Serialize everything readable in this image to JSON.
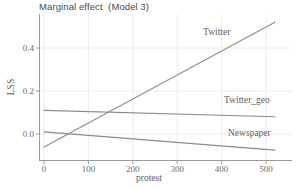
{
  "chart_data": {
    "type": "line",
    "title": "Marginal effect  (Model 3)",
    "xlabel": "protest",
    "ylabel": "LSS",
    "xlim": [
      -18,
      530
    ],
    "ylim": [
      -0.105,
      0.545
    ],
    "xticks": [
      0,
      100,
      200,
      300,
      400,
      500
    ],
    "xticklabels": [
      "0",
      "100",
      "200",
      "300",
      "400",
      "500"
    ],
    "yticks": [
      0.0,
      0.2,
      0.4
    ],
    "yticklabels": [
      "0.0",
      "0.2",
      "0.4"
    ],
    "grid": true,
    "legend_position": "inline-annotations",
    "series": [
      {
        "name": "Twitter",
        "color": "#8c8c8c",
        "x": [
          0,
          520
        ],
        "values": [
          -0.06,
          0.52
        ],
        "annotation": "Twitter"
      },
      {
        "name": "Twitter_geo",
        "color": "#8c8c8c",
        "x": [
          0,
          520
        ],
        "values": [
          0.11,
          0.08
        ],
        "annotation": "Twitter_geo"
      },
      {
        "name": "Newspaper",
        "color": "#8c8c8c",
        "x": [
          0,
          520
        ],
        "values": [
          0.01,
          -0.075
        ],
        "annotation": "Newspaper"
      }
    ]
  },
  "annotations": {
    "twitter": "Twitter",
    "twitter_geo": "Twitter_geo",
    "newspaper": "Newspaper"
  },
  "colors": {
    "line": "#8c8c8c",
    "axis": "#9a9a9a",
    "grid": "#ececf2",
    "background": "#ffffff",
    "text": "#5a5a5a"
  }
}
